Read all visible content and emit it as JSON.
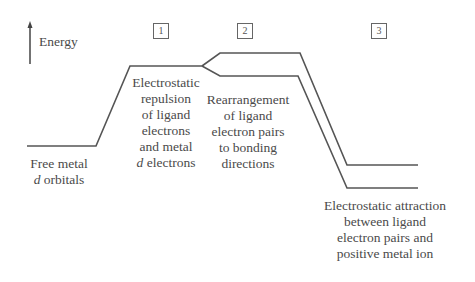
{
  "axis": {
    "label": "Energy"
  },
  "steps": [
    "1",
    "2",
    "3"
  ],
  "labels": {
    "free_metal": {
      "line1": "Free metal",
      "line2_italic": "d",
      "line2_rest": " orbitals"
    },
    "repulsion": {
      "line1": "Electrostatic",
      "line2": "repulsion",
      "line3": "of ligand",
      "line4": "electrons",
      "line5": "and metal",
      "line6_italic": "d",
      "line6_rest": " electrons"
    },
    "rearrangement": {
      "line1": "Rearrangement",
      "line2": "of ligand",
      "line3": "electron pairs",
      "line4": "to bonding",
      "line5": "directions"
    },
    "attraction": {
      "line1": "Electrostatic attraction",
      "line2": "between ligand",
      "line3": "electron pairs and",
      "line4": "positive metal ion"
    }
  },
  "colors": {
    "line": "#555555",
    "text": "#4a4a4a"
  }
}
